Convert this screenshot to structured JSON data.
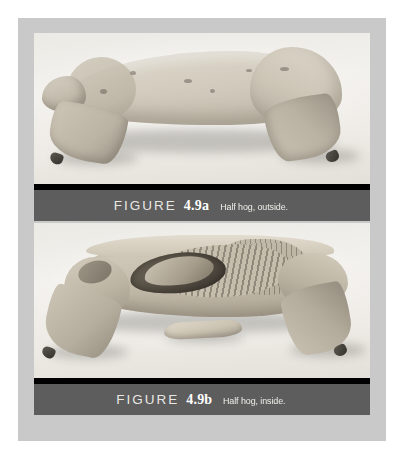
{
  "page": {
    "background_color": "#ffffff",
    "frame_color": "#c9c9c9",
    "caption_band_color": "#5d5d5d",
    "caption_rule_color": "#000000",
    "caption_text_color": "#f0eeea"
  },
  "figures": [
    {
      "id": "4.9a",
      "label_prefix": "FIGURE",
      "number": "4.9a",
      "caption": "Half hog, outside.",
      "photo_alt": "Half hog carcass, exterior skin side, lying on white background"
    },
    {
      "id": "4.9b",
      "label_prefix": "FIGURE",
      "number": "4.9b",
      "caption": "Half hog, inside.",
      "photo_alt": "Half hog carcass, sagittal cut interior showing ribs, loin and body cavity, with a separated bone piece below"
    }
  ]
}
